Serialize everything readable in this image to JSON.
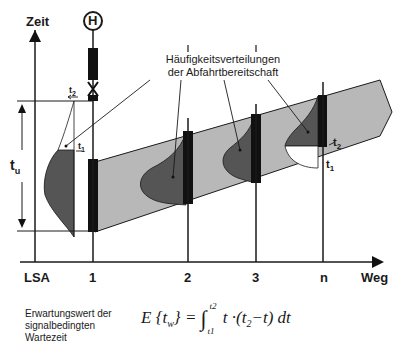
{
  "axes": {
    "y_label": "Zeit",
    "x_label": "Weg"
  },
  "stops": [
    {
      "label": "LSA"
    },
    {
      "label": "1"
    },
    {
      "label": "2"
    },
    {
      "label": "3"
    },
    {
      "label": "n"
    }
  ],
  "callout": {
    "line1": "Häufigkeitsverteilungen",
    "line2": "der Abfahrtbereitschaft"
  },
  "interval_labels": {
    "tu": "t",
    "tu_sub": "u",
    "t1_left": "t",
    "t1_left_sub": "1",
    "t2_left": "t",
    "t2_left_sub": "2",
    "t1_right": "t",
    "t1_right_sub": "1",
    "t2_right": "t",
    "t2_right_sub": "2"
  },
  "stop_symbol": {
    "label": "H"
  },
  "formula": {
    "description_lines": [
      "Erwartungswert der",
      "signalbedingten",
      "Wartezeit"
    ],
    "expression": "E {t_w} = ∫_{t1}^{t2} t·(t2 − t) dt",
    "lhs": "E {t",
    "lhs_sub": "w",
    "lhs_close": "} =",
    "integral": "∫",
    "upper": "t2",
    "lower": "t1",
    "integrand": "t ·(t",
    "integrand_sub": "2",
    "integrand_rest": "−t) dt"
  },
  "colors": {
    "band": "#b8b8b8",
    "distribution": "#555555",
    "signal_bar": "#111111",
    "line": "#1a1a1a"
  }
}
